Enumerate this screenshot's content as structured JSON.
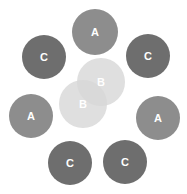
{
  "figure": {
    "type": "cluster-scatter-diagram",
    "background": "#ffffff",
    "width": 187,
    "height": 194
  },
  "palette": {
    "cluster_a": "#8d8d8d",
    "cluster_b": "#d8d8d8",
    "cluster_c": "#6e6e6e",
    "label_color": "#ffffff"
  },
  "legend_groups": [
    {
      "key": "A",
      "label": "A",
      "color": "#8d8d8d",
      "count": 3
    },
    {
      "key": "B",
      "label": "B",
      "color": "#d8d8d8",
      "count": 2
    },
    {
      "key": "C",
      "label": "C",
      "color": "#6e6e6e",
      "count": 4
    }
  ],
  "nodes": [
    {
      "id": "a-top",
      "label": "A",
      "group": "A",
      "cx": 95,
      "cy": 32,
      "r": 23,
      "color_class": "c-mid",
      "translucent": false
    },
    {
      "id": "c-top-left",
      "label": "C",
      "group": "C",
      "cx": 44,
      "cy": 57,
      "r": 22,
      "color_class": "c-dark",
      "translucent": false
    },
    {
      "id": "c-top-right",
      "label": "C",
      "group": "C",
      "cx": 148,
      "cy": 56,
      "r": 22,
      "color_class": "c-dark",
      "translucent": false
    },
    {
      "id": "b-upper",
      "label": "B",
      "group": "B",
      "cx": 101,
      "cy": 82,
      "r": 24,
      "color_class": "c-light",
      "translucent": true
    },
    {
      "id": "b-lower",
      "label": "B",
      "group": "B",
      "cx": 83,
      "cy": 104,
      "r": 24,
      "color_class": "c-light",
      "translucent": true
    },
    {
      "id": "a-left",
      "label": "A",
      "group": "A",
      "cx": 31,
      "cy": 116,
      "r": 22,
      "color_class": "c-mid",
      "translucent": false
    },
    {
      "id": "a-right",
      "label": "A",
      "group": "A",
      "cx": 158,
      "cy": 118,
      "r": 22,
      "color_class": "c-mid",
      "translucent": false
    },
    {
      "id": "c-bottom-left",
      "label": "C",
      "group": "C",
      "cx": 70,
      "cy": 163,
      "r": 22,
      "color_class": "c-dark",
      "translucent": false
    },
    {
      "id": "c-bottom-right",
      "label": "C",
      "group": "C",
      "cx": 125,
      "cy": 162,
      "r": 22,
      "color_class": "c-dark",
      "translucent": false
    }
  ]
}
